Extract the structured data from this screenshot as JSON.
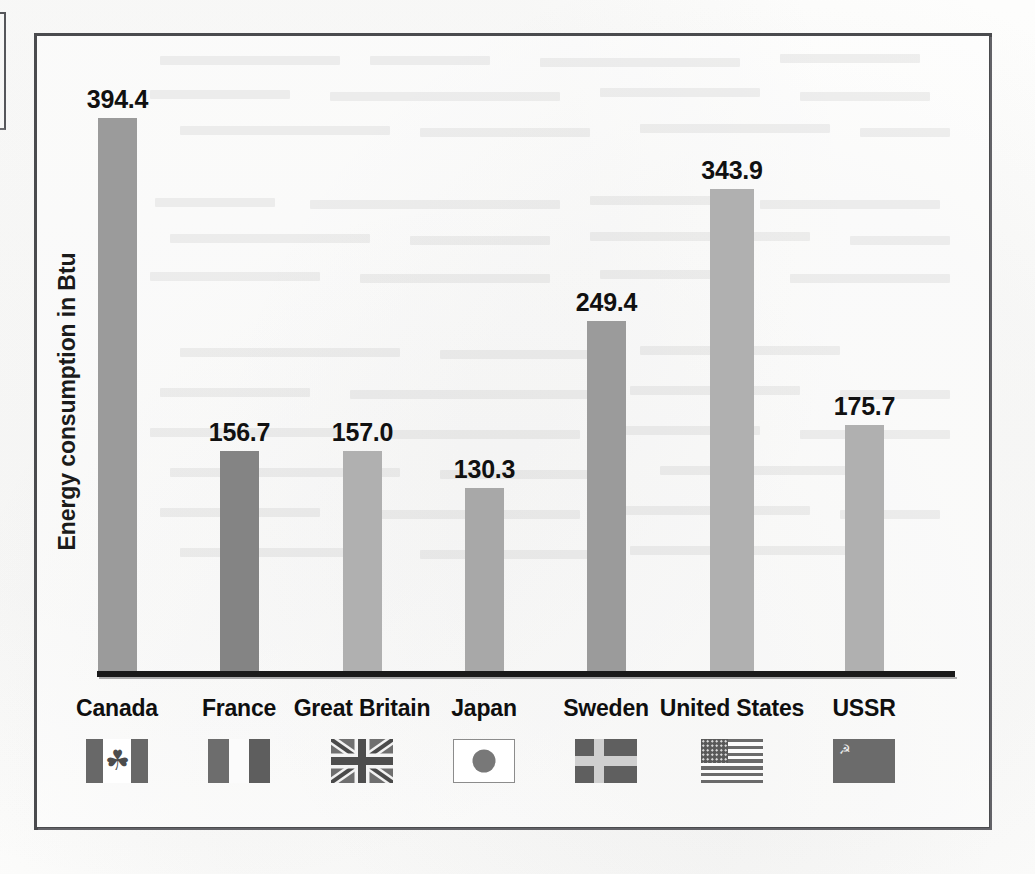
{
  "figure": {
    "y_axis_title": "Energy consumption in Btu"
  },
  "chart_data": {
    "type": "bar",
    "title": "",
    "xlabel": "",
    "ylabel": "Energy consumption in Btu",
    "ylim": [
      0,
      420
    ],
    "grid": false,
    "legend": "none",
    "categories": [
      "Canada",
      "France",
      "Great Britain",
      "Japan",
      "Sweden",
      "United States",
      "USSR"
    ],
    "values": [
      394.4,
      156.7,
      157.0,
      130.3,
      249.4,
      343.9,
      175.7
    ],
    "value_labels": [
      "394.4",
      "156.7",
      "157.0",
      "130.3",
      "249.4",
      "343.9",
      "175.7"
    ],
    "bar_colors": [
      "#9b9b9b",
      "#848484",
      "#b0b0b0",
      "#a8a8a8",
      "#9b9b9b",
      "#b0b0b0",
      "#b0b0b0"
    ],
    "flag_icons": [
      "flag-canada-icon",
      "flag-france-icon",
      "flag-great-britain-icon",
      "flag-japan-icon",
      "flag-sweden-icon",
      "flag-united-states-icon",
      "flag-ussr-icon"
    ]
  },
  "colors": {
    "frame": "#4a4b4e",
    "axis": "#1a1a1a",
    "text": "#111111",
    "paper": "#fdfdfc"
  },
  "glyphs": {
    "maple_leaf": "☘",
    "hammer_sickle": "☭"
  }
}
